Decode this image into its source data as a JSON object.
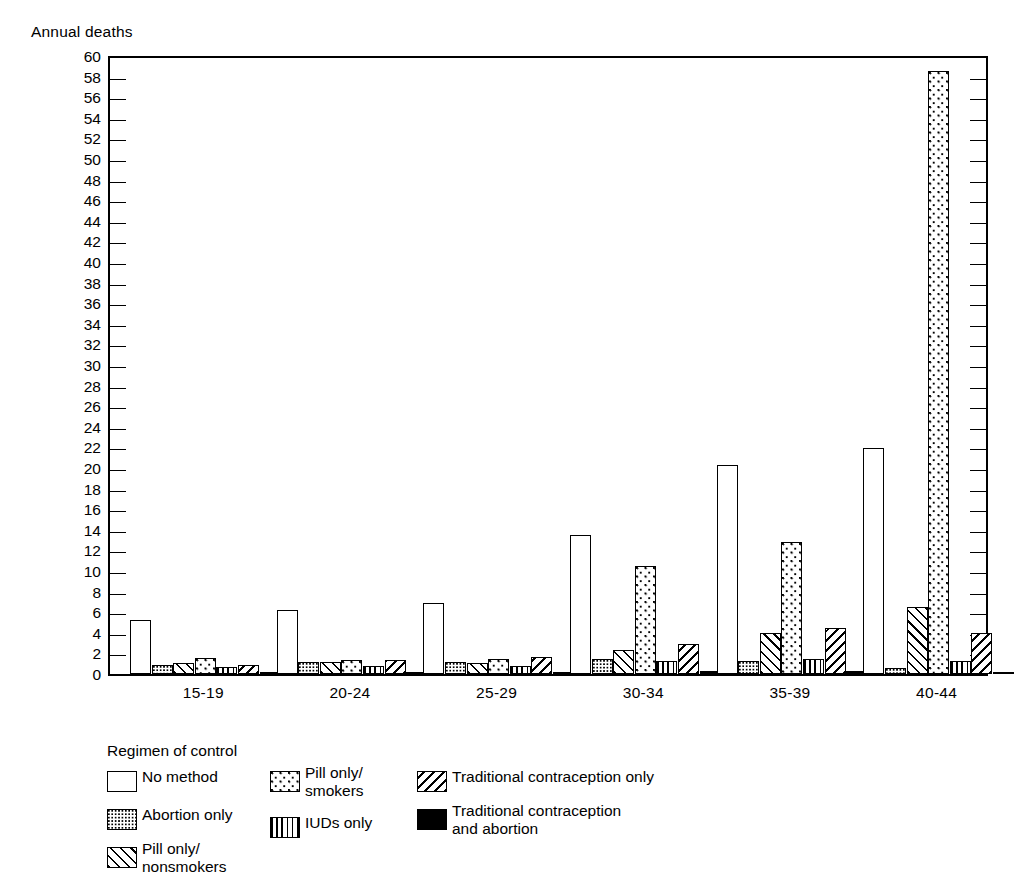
{
  "chart_data": {
    "type": "bar",
    "title": "",
    "ylabel": "Annual deaths",
    "xlabel": "",
    "ylim": [
      0,
      60
    ],
    "ytick_step": 2,
    "grid": false,
    "legend_position": "below-left",
    "legend_title": "Regimen of control",
    "categories": [
      "15-19",
      "20-24",
      "25-29",
      "30-34",
      "35-39",
      "40-44"
    ],
    "ytick_labels": [
      "0",
      "2",
      "4",
      "6",
      "8",
      "10",
      "12",
      "14",
      "16",
      "18",
      "20",
      "22",
      "24",
      "26",
      "28",
      "30",
      "32",
      "34",
      "36",
      "38",
      "40",
      "42",
      "44",
      "46",
      "48",
      "50",
      "52",
      "54",
      "56",
      "58",
      "60"
    ],
    "series": [
      {
        "name": "No method",
        "pattern": "none",
        "values": [
          5.2,
          6.2,
          6.9,
          13.5,
          20.3,
          21.9
        ]
      },
      {
        "name": "Abortion only",
        "pattern": "dots-dense",
        "values": [
          0.9,
          1.2,
          1.2,
          1.5,
          1.3,
          0.6
        ]
      },
      {
        "name": "Pill only/ nonsmokers",
        "pattern": "diag-up",
        "values": [
          1.1,
          1.2,
          1.1,
          2.3,
          4.0,
          6.5
        ]
      },
      {
        "name": "Pill only/ smokers",
        "pattern": "dots-sparse",
        "values": [
          1.6,
          1.4,
          1.5,
          10.5,
          12.8,
          58.5
        ]
      },
      {
        "name": "IUDs only",
        "pattern": "vert",
        "values": [
          0.7,
          0.8,
          0.8,
          1.3,
          1.5,
          1.3
        ]
      },
      {
        "name": "Traditional contraception only",
        "pattern": "diag-down",
        "values": [
          0.9,
          1.4,
          1.7,
          2.9,
          4.5,
          4.0
        ]
      },
      {
        "name": "Traditional contraception and abortion",
        "pattern": "solid",
        "values": [
          0.15,
          0.18,
          0.2,
          0.25,
          0.3,
          0.2
        ]
      }
    ]
  },
  "legend": {
    "title": "Regimen of control",
    "column1": [
      {
        "label": "No method",
        "pattern": "none"
      },
      {
        "label": "Abortion only",
        "pattern": "dots-dense"
      },
      {
        "label": "Pill only/\n  nonsmokers",
        "pattern": "diag-up"
      }
    ],
    "column2": [
      {
        "label": "Pill only/\n  smokers",
        "pattern": "dots-sparse"
      },
      {
        "label": "IUDs only",
        "pattern": "vert"
      }
    ],
    "column3": [
      {
        "label": "Traditional contraception only",
        "pattern": "diag-down"
      },
      {
        "label": "Traditional contraception\nand abortion",
        "pattern": "solid"
      }
    ]
  }
}
